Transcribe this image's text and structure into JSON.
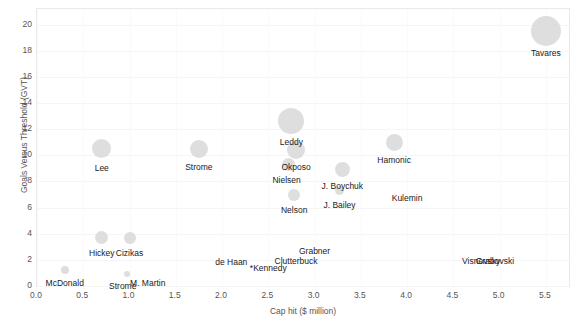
{
  "chart_data": {
    "type": "scatter",
    "title": "",
    "xlabel": "Cap hit ($ million)",
    "ylabel": "Goals Versus Threshold (GVT)",
    "xlim": [
      0.0,
      5.75
    ],
    "ylim": [
      0,
      21.2
    ],
    "xticks": [
      "0.0",
      "0.5",
      "1.0",
      "1.5",
      "2.0",
      "2.5",
      "3.0",
      "3.5",
      "4.0",
      "4.5",
      "5.0",
      "5.5"
    ],
    "xtick_values": [
      0.0,
      0.5,
      1.0,
      1.5,
      2.0,
      2.5,
      3.0,
      3.5,
      4.0,
      4.5,
      5.0,
      5.5
    ],
    "yticks": [
      "0",
      "2",
      "4",
      "6",
      "8",
      "10",
      "12",
      "14",
      "16",
      "18",
      "20"
    ],
    "ytick_values": [
      0,
      2,
      4,
      6,
      8,
      10,
      12,
      14,
      16,
      18,
      20
    ],
    "grid": true,
    "legend": "none",
    "bubble_color": "#d9d9d9",
    "points": [
      {
        "label": "Tavares",
        "x": 5.5,
        "y": 19.5,
        "size": 30,
        "label_dx": 0,
        "label_dy": 22
      },
      {
        "label": "Leddy",
        "x": 2.75,
        "y": 12.6,
        "size": 26,
        "label_dx": 0,
        "label_dy": 21
      },
      {
        "label": "Okposo",
        "x": 2.8,
        "y": 10.4,
        "size": 18,
        "label_dx": 0,
        "label_dy": 17
      },
      {
        "label": "Nielsen",
        "x": 2.72,
        "y": 9.3,
        "size": 13,
        "label_dx": -2,
        "label_dy": 16
      },
      {
        "label": "Hamonic",
        "x": 3.86,
        "y": 11.0,
        "size": 17,
        "label_dx": 0,
        "label_dy": 18
      },
      {
        "label": "Lee",
        "x": 0.7,
        "y": 10.5,
        "size": 19,
        "label_dx": 0,
        "label_dy": 19
      },
      {
        "label": "Strome",
        "x": 1.75,
        "y": 10.5,
        "size": 18,
        "label_dx": 0,
        "label_dy": 18
      },
      {
        "label": "J. Boychuk",
        "x": 3.3,
        "y": 8.9,
        "size": 15,
        "label_dx": 0,
        "label_dy": 16
      },
      {
        "label": "J. Bailey",
        "x": 3.27,
        "y": 7.3,
        "size": 9,
        "label_dx": 0,
        "label_dy": 14
      },
      {
        "label": "Nelson",
        "x": 2.78,
        "y": 7.0,
        "size": 12,
        "label_dx": 0,
        "label_dy": 15
      },
      {
        "label": "Kulemin",
        "x": 4.0,
        "y": 7.2,
        "size": 0,
        "label_dx": 0,
        "label_dy": 6
      },
      {
        "label": "Hickey",
        "x": 0.7,
        "y": 3.7,
        "size": 13,
        "label_dx": 0,
        "label_dy": 15
      },
      {
        "label": "Cizikas",
        "x": 1.0,
        "y": 3.7,
        "size": 12,
        "label_dx": 0,
        "label_dy": 15
      },
      {
        "label": "Grabner",
        "x": 3.0,
        "y": 3.1,
        "size": 0,
        "label_dx": 0,
        "label_dy": 6
      },
      {
        "label": "Clutterbuck",
        "x": 2.8,
        "y": 2.4,
        "size": 0,
        "label_dx": 0,
        "label_dy": 6
      },
      {
        "label": "de Haan",
        "x": 2.1,
        "y": 2.3,
        "size": 0,
        "label_dx": 0,
        "label_dy": 6
      },
      {
        "label": "*Kennedy",
        "x": 2.5,
        "y": 1.8,
        "size": 0,
        "label_dx": 0,
        "label_dy": 6
      },
      {
        "label": "Visnovsky",
        "x": 4.8,
        "y": 2.4,
        "size": 0,
        "label_dx": 0,
        "label_dy": 6
      },
      {
        "label": "Grabovski",
        "x": 4.95,
        "y": 2.4,
        "size": 0,
        "label_dx": 0,
        "label_dy": 6
      },
      {
        "label": "McDonald",
        "x": 0.3,
        "y": 1.2,
        "size": 8,
        "label_dx": 0,
        "label_dy": 13
      },
      {
        "label": "Strome ",
        "x": 0.97,
        "y": 0.9,
        "size": 6,
        "label_dx": -4,
        "label_dy": 12
      },
      {
        "label": "M. Martin",
        "x": 1.1,
        "y": 0.7,
        "size": 0,
        "label_dx": 9,
        "label_dy": 6
      }
    ]
  },
  "axes": {
    "x_title": "Cap hit ($ million)",
    "y_title": "Goals Versus Threshold (GVT)"
  }
}
